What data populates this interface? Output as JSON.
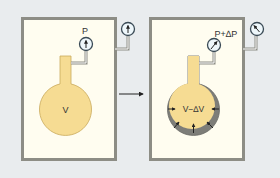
{
  "left_panel": {
    "gauge_label": "P",
    "flask_label": "V"
  },
  "arrow": {
    "direction": "right"
  },
  "right_panel": {
    "gauge_label": "P+∆P",
    "flask_label": "V−∆V"
  },
  "colors": {
    "background": "#e9ecee",
    "chamber_fill": "#fffdf0",
    "chamber_border": "#8d8d85",
    "flask_fill": "#f6dc93",
    "flask_border": "#c9aa5c",
    "compressed_shell": "#7d7d78",
    "gauge_face": "#eef7fb",
    "gauge_border": "#3a4a55",
    "pipe": "#8d8d85"
  }
}
